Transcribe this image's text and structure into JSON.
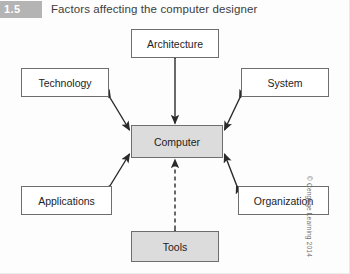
{
  "header": {
    "badge": "1.5",
    "badge_color": "#b4b4b4",
    "title": "Factors affecting the computer designer"
  },
  "diagram": {
    "type": "node-arrow-diagram",
    "center_node": "Computer",
    "nodes": [
      {
        "id": "architecture",
        "label": "Architecture",
        "fill": "#ffffff",
        "position": "top-center"
      },
      {
        "id": "technology",
        "label": "Technology",
        "fill": "#ffffff",
        "position": "top-left"
      },
      {
        "id": "system",
        "label": "System",
        "fill": "#ffffff",
        "position": "top-right"
      },
      {
        "id": "computer",
        "label": "Computer",
        "fill": "#dcdcdc",
        "position": "center"
      },
      {
        "id": "applications",
        "label": "Applications",
        "fill": "#ffffff",
        "position": "bottom-left"
      },
      {
        "id": "organization",
        "label": "Organization",
        "fill": "#ffffff",
        "position": "bottom-right"
      },
      {
        "id": "tools",
        "label": "Tools",
        "fill": "#dcdcdc",
        "position": "bottom-center"
      }
    ],
    "edges": [
      {
        "from": "architecture",
        "to": "computer",
        "style": "solid",
        "arrows": "both"
      },
      {
        "from": "technology",
        "to": "computer",
        "style": "solid",
        "arrows": "both"
      },
      {
        "from": "system",
        "to": "computer",
        "style": "solid",
        "arrows": "both"
      },
      {
        "from": "applications",
        "to": "computer",
        "style": "solid",
        "arrows": "both"
      },
      {
        "from": "organization",
        "to": "computer",
        "style": "solid",
        "arrows": "both"
      },
      {
        "from": "tools",
        "to": "computer",
        "style": "dashed",
        "arrows": "both"
      }
    ],
    "line_color": "#2a2a2a",
    "border_color": "#6e6e6e"
  },
  "footer": {
    "copyright": "© Cengage Learning 2014"
  }
}
